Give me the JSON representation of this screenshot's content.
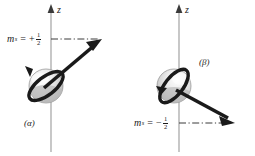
{
  "figure": {
    "width": 255,
    "height": 156,
    "background": "#ffffff",
    "ink_color": "#1a1a1a",
    "axis_color": "#9a9a9a",
    "sphere_light": "#f2f2f2",
    "sphere_mid": "#d9d9d9",
    "sphere_dark": "#b4b4b4"
  },
  "panels": [
    {
      "id": "alpha",
      "panel_label": "(α)",
      "axis_label": "z",
      "ms_variable": "m",
      "ms_subscript": "s",
      "ms_equals": "=",
      "ms_sign": "+",
      "ms_numerator": "1",
      "ms_denominator": "2",
      "ms_full": "m_s = +1/2",
      "spin_direction": "up",
      "vector_description": "bold arrow angled up and to the right",
      "projection_line": "dash-dot horizontal line from z-axis to arrow tip"
    },
    {
      "id": "beta",
      "panel_label": "(β)",
      "axis_label": "z",
      "ms_variable": "m",
      "ms_subscript": "s",
      "ms_equals": "=",
      "ms_sign": "−",
      "ms_numerator": "1",
      "ms_denominator": "2",
      "ms_full": "m_s = -1/2",
      "spin_direction": "down",
      "vector_description": "bold arrow angled down and to the right",
      "projection_line": "dash-dot horizontal line from z-axis to arrow tip"
    }
  ]
}
